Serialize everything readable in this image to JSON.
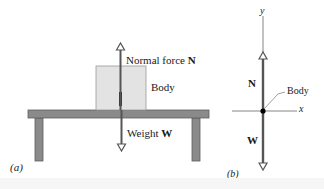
{
  "figure": {
    "panel_a": {
      "label": "(a)",
      "normal_force": {
        "text": "Normal force ",
        "symbol": "N"
      },
      "body_label": "Body",
      "weight": {
        "text": "Weight ",
        "symbol": "W"
      }
    },
    "panel_b": {
      "label": "(b)",
      "y_axis_label": "y",
      "x_axis_label": "x",
      "normal_symbol": "N",
      "weight_symbol": "W",
      "body_label": "Body"
    }
  },
  "colors": {
    "table": "#8a8a8a",
    "table_edge": "#5e5e5e",
    "body_fill": "#e3e3e3",
    "body_edge": "#9a9a9a",
    "vector": "#555555",
    "axis": "#666666",
    "dot": "#000000"
  }
}
